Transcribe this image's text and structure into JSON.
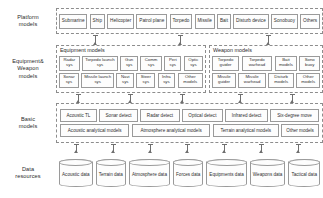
{
  "diagram": {
    "tiers": [
      {
        "id": "platform",
        "label": "Platform\nmodels",
        "label_line1": "Platform",
        "label_line2": "models",
        "nodes": [
          "Submarine",
          "Ship",
          "Helicopter",
          "Patrol plane",
          "Torpedo",
          "Missile",
          "Bait",
          "Disturb device",
          "Sonobuoy",
          "Others"
        ]
      },
      {
        "id": "equipment-weapon",
        "label_line1": "Equipment&",
        "label_line2": "Weapon",
        "label_line3": "models",
        "groups": [
          {
            "id": "equipment",
            "title": "Equipment models",
            "row1": [
              "Radar sys",
              "Torpedo launch sys",
              "Gun sys",
              "Comm sys",
              "Peri sys",
              "Optic sys"
            ],
            "row2": [
              "Sonar sys",
              "Missile launch sys",
              "Navi sys",
              "Steer sys",
              "Infra sys",
              "Other models"
            ]
          },
          {
            "id": "weapon",
            "title": "Weapon models",
            "row1": [
              "Torpedo guider",
              "Torpedo warhead",
              "Bait models",
              "Sono buoy"
            ],
            "row2": [
              "Missile guider",
              "Missile warhead",
              "Disturb models",
              "Other models"
            ]
          }
        ]
      },
      {
        "id": "basic",
        "label_line1": "Basic",
        "label_line2": "models",
        "row1": [
          "Acoustic TL",
          "Sonar detect",
          "Radar detect",
          "Optical detect",
          "Infrared detect",
          "Six-degree move"
        ],
        "row2": [
          "Acoustic analytical models",
          "Atmosphere analytical models",
          "Terrain analytical models",
          "Other models"
        ]
      },
      {
        "id": "data",
        "label_line1": "Data",
        "label_line2": "resources",
        "stores": [
          "Acoustic data",
          "Terrain data",
          "Atmosphere data",
          "Forces data",
          "Equipments data",
          "Weapons data",
          "Tactical data"
        ]
      }
    ],
    "colors": {
      "frame_dash": "#8d8d8d",
      "node_border": "#9a9a9a",
      "arrow": "#6f6f6f",
      "text": "#2b2b2b",
      "background": "#ffffff"
    }
  }
}
